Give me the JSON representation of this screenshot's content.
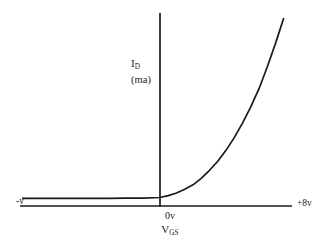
{
  "figure": {
    "background_color": "#ffffff",
    "ink_color": "#1a1a1a"
  },
  "axes": {
    "y_axis": {
      "quantity_label": "I",
      "quantity_subscript": "D",
      "unit_label": "(ma)"
    },
    "x_axis": {
      "left_end_label": "-v",
      "right_end_label": "+8v",
      "origin_label": "0v",
      "quantity_label": "V",
      "quantity_subscript": "GS"
    }
  },
  "chart_data": {
    "type": "line",
    "title": "",
    "xlabel": "VGS",
    "ylabel": "ID (ma)",
    "xlim": [
      -8,
      8
    ],
    "ylim": [
      0,
      10
    ],
    "grid": false,
    "legend": null,
    "annotations": [
      {
        "text": "-v",
        "position": "x-axis-left-end"
      },
      {
        "text": "+8v",
        "position": "x-axis-right-end"
      },
      {
        "text": "0v",
        "position": "origin-below"
      },
      {
        "text": "VGS",
        "position": "x-axis-title-below-origin"
      },
      {
        "text": "ID",
        "position": "y-axis-title-left-of-axis"
      },
      {
        "text": "(ma)",
        "position": "y-axis-unit-left-of-axis"
      }
    ],
    "series": [
      {
        "name": "drain current vs gate-source voltage",
        "description": "Flat near zero for negative VGS, then rising exponentially for positive VGS",
        "x": [
          -8.0,
          -7.0,
          -6.0,
          -5.0,
          -4.0,
          -3.0,
          -2.0,
          -1.0,
          0.0,
          0.5,
          1.0,
          1.5,
          2.0,
          2.5,
          3.0,
          3.5,
          4.0,
          4.5,
          5.0,
          5.5,
          6.0,
          6.5,
          7.0,
          7.5
        ],
        "y": [
          0.05,
          0.05,
          0.05,
          0.05,
          0.05,
          0.05,
          0.06,
          0.07,
          0.1,
          0.2,
          0.35,
          0.55,
          0.8,
          1.15,
          1.6,
          2.1,
          2.7,
          3.4,
          4.2,
          5.1,
          6.1,
          7.3,
          8.6,
          10.0
        ]
      }
    ]
  },
  "geometry": {
    "x_axis_pixels": {
      "x1": 20,
      "y1": 206,
      "x2": 292,
      "y2": 206
    },
    "y_axis_pixels": {
      "x1": 160,
      "y1": 13,
      "x2": 160,
      "y2": 206
    },
    "curve_path": "M 22 199.5 L 160 199.5 C 178 199.5 192 196 204 189 C 224 177 242 155 260 123 C 274 98 290 58 305 18"
  }
}
